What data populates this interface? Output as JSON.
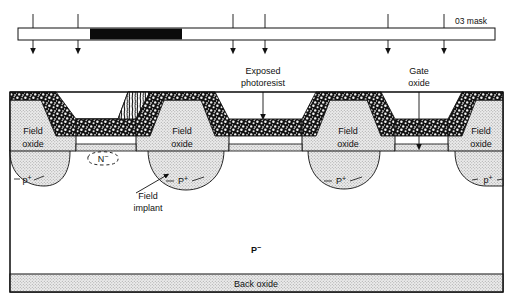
{
  "figure": {
    "type": "semiconductor-cross-section"
  },
  "mask": {
    "label": "03 mask",
    "opaque_region": {
      "x_start": 90,
      "x_end": 182
    },
    "bar": {
      "x": 18,
      "y": 28,
      "width": 477,
      "height": 12
    },
    "arrow_x_positions": [
      33,
      78,
      233,
      265,
      388,
      444
    ],
    "arrow_count": 6
  },
  "callouts": [
    {
      "name": "exposed-photoresist",
      "line1": "Exposed",
      "line2": "photoresist",
      "text_x": 263,
      "text_y": 74,
      "arrow_from_y": 92,
      "arrow_to_y": 117,
      "arrow_x": 263
    },
    {
      "name": "gate-oxide",
      "line1": "Gate",
      "line2": "oxide",
      "text_x": 419,
      "text_y": 74,
      "arrow_from_y": 92,
      "arrow_to_y": 146,
      "arrow_x": 419
    },
    {
      "name": "field-implant",
      "line1": "Field",
      "line2": "implant",
      "text_x": 148,
      "text_y": 196,
      "arrow_tip_x": 166,
      "arrow_tip_y": 176
    }
  ],
  "regions": [
    {
      "name": "field-oxide-1",
      "line1": "Field",
      "line2": "oxide",
      "x": 33,
      "y": 131
    },
    {
      "name": "field-oxide-2",
      "line1": "Field",
      "line2": "oxide",
      "x": 178,
      "y": 131
    },
    {
      "name": "field-oxide-3",
      "line1": "Field",
      "line2": "oxide",
      "x": 345,
      "y": 131
    },
    {
      "name": "field-oxide-4",
      "line1": "Field",
      "line2": "oxide",
      "x": 483,
      "y": 131
    }
  ],
  "implants": [
    {
      "name": "p-plus-1",
      "label": "p",
      "sup": "+",
      "x": 24,
      "y": 180
    },
    {
      "name": "p-plus-2",
      "label": "P",
      "sup": "+",
      "x": 182,
      "y": 180
    },
    {
      "name": "P-plus-3",
      "label": "P",
      "sup": "+",
      "x": 339,
      "y": 180
    },
    {
      "name": "p-plus-4",
      "label": "p",
      "sup": "+",
      "x": 487,
      "y": 180
    }
  ],
  "substrate": {
    "name": "p-minus-substrate",
    "label": "P",
    "sup": "−",
    "x": 256,
    "y": 250
  },
  "n_region": {
    "name": "n-minus-region",
    "label": "N",
    "sup": "−",
    "x": 102,
    "y": 158
  },
  "back_oxide": {
    "name": "back-oxide",
    "label": "Back oxide",
    "x": 256,
    "y": 285
  },
  "colors": {
    "outline": "#1a1a1a",
    "oxide_fill": "#e2e2e2",
    "photoresist_dark": "#1c1c1c",
    "photoresist_exposed": "#f2f2f2",
    "substrate": "#ffffff",
    "mask_opaque": "#0b0b0b",
    "mask_clear": "#ffffff",
    "background": "#ffffff"
  }
}
